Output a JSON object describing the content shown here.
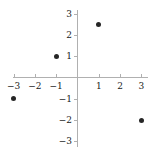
{
  "chart_data": {
    "type": "scatter",
    "title": "",
    "subtitle": "",
    "xlabel": "",
    "ylabel": "",
    "xlim": [
      -3.4,
      3.4
    ],
    "ylim": [
      -3.4,
      3.4
    ],
    "grid": false,
    "legend": null,
    "point_color": "#262626",
    "axis_color": "#b0b0b0",
    "label_color": "#1a1a1a",
    "xticks": [
      -3,
      -2,
      -1,
      1,
      2,
      3
    ],
    "yticks": [
      3,
      2,
      1,
      -1,
      -2,
      -3
    ],
    "xtick_labels": [
      "-3",
      "-2",
      "-1",
      "1",
      "2",
      "3"
    ],
    "ytick_labels": [
      "3",
      "2",
      "1",
      "-1",
      "-2",
      "-3"
    ],
    "points": [
      {
        "x": 1,
        "y": 2.5,
        "label": "(1, 2.5)"
      },
      {
        "x": -1,
        "y": 1,
        "label": "(-1, 1)"
      },
      {
        "x": -3,
        "y": -1,
        "label": "(-3, -1)"
      },
      {
        "x": 3,
        "y": -2,
        "label": "(3, -2)"
      }
    ]
  }
}
